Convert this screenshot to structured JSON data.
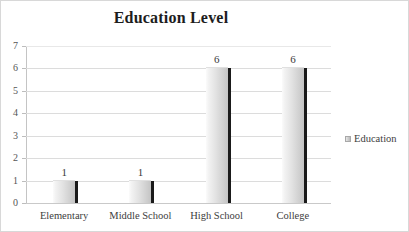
{
  "chart_data": {
    "type": "bar",
    "title": "Education Level",
    "categories": [
      "Elementary",
      "Middle School",
      "High School",
      "College"
    ],
    "values": [
      1,
      1,
      6,
      6
    ],
    "data_labels": [
      "1",
      "1",
      "6",
      "6"
    ],
    "series": [
      {
        "name": "Education",
        "values": [
          1,
          1,
          6,
          6
        ]
      }
    ],
    "xlabel": "",
    "ylabel": "",
    "ylim": [
      0,
      7
    ],
    "y_ticks": [
      0,
      1,
      2,
      3,
      4,
      5,
      6,
      7
    ],
    "y_tick_labels": [
      "0",
      "1",
      "2",
      "3",
      "4",
      "5",
      "6",
      "7"
    ],
    "grid": true,
    "legend_position": "right",
    "legend_entries": [
      "Education"
    ],
    "colors": {
      "bar_fill_light": "#fbfbfb",
      "bar_fill_dark": "#c4c4c4",
      "bar_shadow": "#1a1a1a",
      "gridline": "#dcdcdc",
      "title_text": "#1d1d1d",
      "axis_text": "#555555",
      "frame_border": "#d8d8d8",
      "background": "#ffffff"
    }
  },
  "legend": {
    "swatch_icon": "legend-square-icon",
    "label": "Education"
  }
}
